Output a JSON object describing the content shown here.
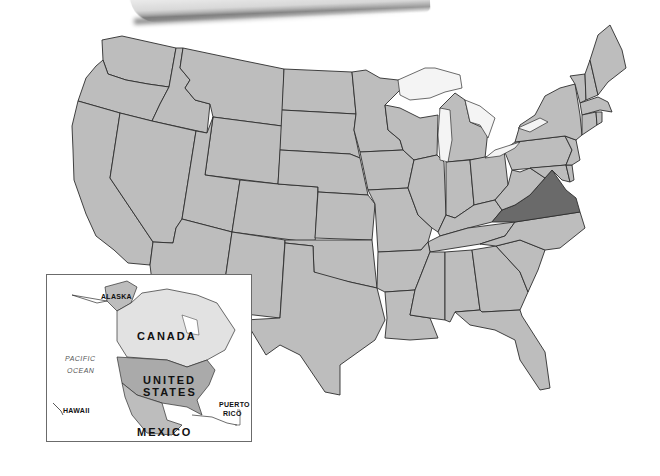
{
  "map": {
    "title": "United States",
    "highlighted_state": "Virginia",
    "colors": {
      "state_fill": "#bdbdbd",
      "highlight_fill": "#6a6a6a",
      "border": "#2e2e2e",
      "lakes": "#f4f4f4",
      "background": "#ffffff"
    }
  },
  "inset": {
    "labels": {
      "alaska": "ALASKA",
      "canada": "CANADA",
      "pacific_ocean_line1": "PACIFIC",
      "pacific_ocean_line2": "OCEAN",
      "united_states_line1": "UNITED",
      "united_states_line2": "STATES",
      "hawaii": "HAWAII",
      "puerto_rico_line1": "PUERTO",
      "puerto_rico_line2": "RICO",
      "mexico": "MEXICO"
    }
  }
}
